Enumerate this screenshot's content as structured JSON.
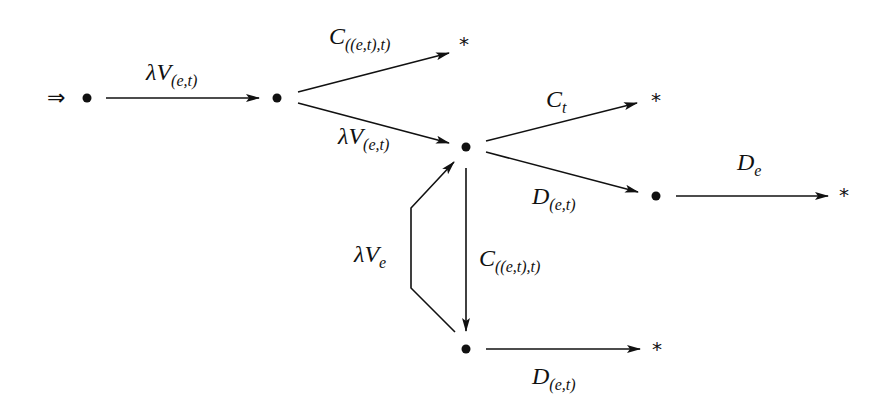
{
  "diagram": {
    "start_symbol": "⇒",
    "terminal_symbol": "*",
    "nodes": [
      {
        "id": "n1",
        "x": 87,
        "y": 98
      },
      {
        "id": "n2",
        "x": 277,
        "y": 98
      },
      {
        "id": "n3",
        "x": 466,
        "y": 147
      },
      {
        "id": "n4",
        "x": 656,
        "y": 196
      },
      {
        "id": "n5",
        "x": 466,
        "y": 349
      }
    ],
    "terminals": [
      {
        "id": "t1",
        "x": 465,
        "y": 43
      },
      {
        "id": "t2",
        "x": 657,
        "y": 98
      },
      {
        "id": "t3",
        "x": 845,
        "y": 193
      },
      {
        "id": "t4",
        "x": 658,
        "y": 347
      }
    ],
    "edges": [
      {
        "from": "n1",
        "to": "n2",
        "label_main": "λV",
        "label_sub": "(e,t)"
      },
      {
        "from": "n2",
        "to": "t1",
        "label_main": "C",
        "label_sub": "((e,t),t)"
      },
      {
        "from": "n2",
        "to": "n3",
        "label_main": "λV",
        "label_sub": "(e,t)"
      },
      {
        "from": "n3",
        "to": "t2",
        "label_main": "C",
        "label_sub": "t"
      },
      {
        "from": "n3",
        "to": "n4",
        "label_main": "D",
        "label_sub": "(e,t)"
      },
      {
        "from": "n4",
        "to": "t3",
        "label_main": "D",
        "label_sub": "e"
      },
      {
        "from": "n3",
        "to": "n5",
        "label_main": "C",
        "label_sub": "((e,t),t)"
      },
      {
        "from": "n5",
        "to": "n3",
        "label_main": "λV",
        "label_sub": "e"
      },
      {
        "from": "n5",
        "to": "t4",
        "label_main": "D",
        "label_sub": "(e,t)"
      }
    ]
  }
}
